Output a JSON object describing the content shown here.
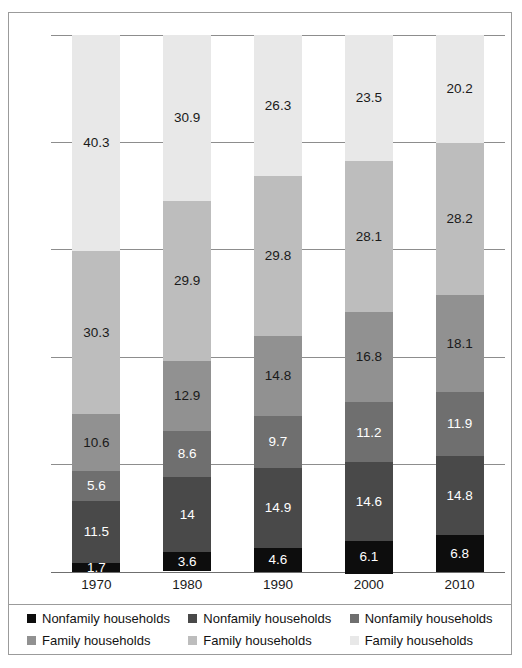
{
  "figure": {
    "top_caption_sliver": "",
    "background_color": "#ffffff",
    "frame_color": "#9b9b9b"
  },
  "axes": {
    "y_ticks": [
      "0",
      "20",
      "40",
      "60",
      "80",
      "100"
    ],
    "y_min": 0,
    "y_max": 100,
    "x_ticks": [
      "1970",
      "1980",
      "1990",
      "2000",
      "2010"
    ]
  },
  "legend": {
    "items": [
      {
        "label": "Nonfamily households",
        "color": "#0d0d0d",
        "name": "legend-nonfamily-1"
      },
      {
        "label": "Nonfamily households",
        "color": "#494949",
        "name": "legend-nonfamily-2"
      },
      {
        "label": "Nonfamily households",
        "color": "#6f6f6f",
        "name": "legend-nonfamily-3"
      },
      {
        "label": "Family households",
        "color": "#919191",
        "name": "legend-family-1"
      },
      {
        "label": "Family households",
        "color": "#bdbdbd",
        "name": "legend-family-2"
      },
      {
        "label": "Family households",
        "color": "#e8e8e8",
        "name": "legend-family-3"
      }
    ]
  },
  "chart_data": {
    "type": "bar",
    "subtype": "stacked-bar-100",
    "title": "",
    "xlabel": "",
    "ylabel": "",
    "ylim": [
      0,
      100
    ],
    "grid": true,
    "legend_position": "bottom",
    "categories": [
      "1970",
      "1980",
      "1990",
      "2000",
      "2010"
    ],
    "series": [
      {
        "name": "Nonfamily households",
        "legend_index": 0,
        "color": "#0d0d0d",
        "label_color": "#ffffff",
        "values": [
          1.7,
          3.6,
          4.6,
          6.1,
          6.8
        ]
      },
      {
        "name": "Nonfamily households",
        "legend_index": 1,
        "color": "#494949",
        "label_color": "#ffffff",
        "values": [
          11.5,
          14,
          14.9,
          14.6,
          14.8
        ]
      },
      {
        "name": "Nonfamily households",
        "legend_index": 2,
        "color": "#6f6f6f",
        "label_color": "#ffffff",
        "values": [
          5.6,
          8.6,
          9.7,
          11.2,
          11.9
        ]
      },
      {
        "name": "Family households",
        "legend_index": 3,
        "color": "#919191",
        "label_color": "#1a1a1a",
        "values": [
          10.6,
          12.9,
          14.8,
          16.8,
          18.1
        ]
      },
      {
        "name": "Family households",
        "legend_index": 4,
        "color": "#bdbdbd",
        "label_color": "#1a1a1a",
        "values": [
          30.3,
          29.9,
          29.8,
          28.1,
          28.2
        ]
      },
      {
        "name": "Family households",
        "legend_index": 5,
        "color": "#e8e8e8",
        "label_color": "#1a1a1a",
        "values": [
          40.3,
          30.9,
          26.3,
          23.5,
          20.2
        ]
      }
    ],
    "data_labels": {
      "1970": [
        "1.7",
        "11.5",
        "5.6",
        "10.6",
        "30.3",
        "40.3"
      ],
      "1980": [
        "3.6",
        "14",
        "8.6",
        "12.9",
        "29.9",
        "30.9"
      ],
      "1990": [
        "4.6",
        "14.9",
        "9.7",
        "14.8",
        "29.8",
        "26.3"
      ],
      "2000": [
        "6.1",
        "14.6",
        "11.2",
        "16.8",
        "28.1",
        "23.5"
      ],
      "2010": [
        "6.8",
        "14.8",
        "11.9",
        "18.1",
        "28.2",
        "20.2"
      ]
    }
  }
}
